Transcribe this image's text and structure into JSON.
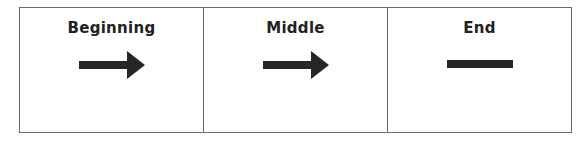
{
  "diagram": {
    "cells": [
      {
        "label": "Beginning",
        "symbol": "right-arrow"
      },
      {
        "label": "Middle",
        "symbol": "right-arrow"
      },
      {
        "label": "End",
        "symbol": "horizontal-line"
      }
    ],
    "colors": {
      "border": "#6a6a6a",
      "symbol": "#262626",
      "text": "#222222"
    }
  }
}
